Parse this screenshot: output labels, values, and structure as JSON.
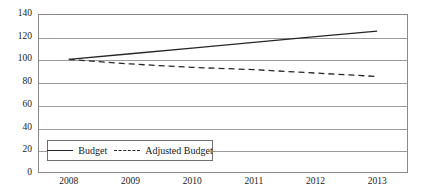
{
  "chart_data": {
    "type": "line",
    "title": "",
    "xlabel": "",
    "ylabel": "",
    "x": [
      "2008",
      "2009",
      "2010",
      "2011",
      "2012",
      "2013"
    ],
    "categories": [
      "2008",
      "2009",
      "2010",
      "2011",
      "2012",
      "2013"
    ],
    "series": [
      {
        "name": "Budget",
        "style": "solid",
        "color": "#262626",
        "values": [
          100,
          105,
          110,
          115,
          120,
          125
        ]
      },
      {
        "name": "Adjusted Budget",
        "style": "dashed",
        "color": "#262626",
        "values": [
          100,
          96,
          93,
          91,
          88,
          85
        ]
      }
    ],
    "ylim": [
      0,
      140
    ],
    "yticks": [
      0,
      20,
      40,
      60,
      80,
      100,
      120,
      140
    ],
    "ytick_labels": [
      "0",
      "20",
      "40",
      "60",
      "80",
      "100",
      "120",
      "140"
    ],
    "xtick_labels": [
      "2008",
      "2009",
      "2010",
      "2011",
      "2012",
      "2013"
    ],
    "grid": true,
    "grid_axis": "y",
    "legend_position": "bottom-left-inside",
    "legend_entries": [
      "Budget",
      "Adjusted Budget"
    ],
    "frame": true
  },
  "legend": {
    "items": [
      {
        "label": "Budget",
        "key": "solid-line-key-icon"
      },
      {
        "label": "Adjusted Budget",
        "key": "dashed-line-key-icon"
      }
    ]
  },
  "colors": {
    "line": "#262626",
    "grid": "#9b9b9b",
    "frame": "#8a8a8a",
    "text": "#1a1a1a",
    "background": "#ffffff"
  }
}
